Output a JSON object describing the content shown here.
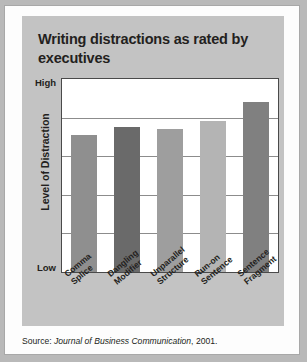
{
  "title": "Writing distractions as rated by executives",
  "axis": {
    "y_title": "Level of Distraction",
    "y_high": "High",
    "y_low": "Low"
  },
  "source": {
    "prefix": "Source: ",
    "journal": "Journal of Business Communication",
    "suffix": ", 2001."
  },
  "colors": {
    "card_background": "#fdfdfd",
    "panel_background": "#c3c3c3",
    "plot_background": "#ffffff",
    "grid": "#8c8c8c",
    "frame": "#4a4a4a",
    "text": "#231f20"
  },
  "chart_data": {
    "type": "bar",
    "title": "Writing distractions as rated by executives",
    "xlabel": "",
    "ylabel": "Level of Distraction",
    "ylim": [
      0,
      100
    ],
    "ytick_labels": [
      "Low",
      "High"
    ],
    "grid": true,
    "gridlines": [
      20,
      40,
      60,
      80
    ],
    "legend": "none",
    "categories": [
      "Comma Splice",
      "Dangling Modifier",
      "Unparallel Structure",
      "Run-on Sentence",
      "Sentence Fragment"
    ],
    "values": [
      71,
      75,
      74,
      78,
      88
    ],
    "bar_colors": [
      "#8f8f8f",
      "#6a6a6a",
      "#9e9e9e",
      "#b4b4b4",
      "#808080"
    ]
  }
}
